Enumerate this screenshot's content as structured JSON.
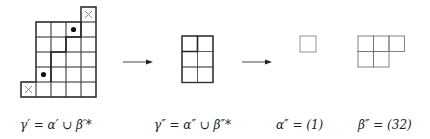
{
  "colors": {
    "grid_line": "#555555",
    "thick_line": "#222222",
    "light_line": "#888888",
    "dot": "#111111",
    "cross": "#888888"
  },
  "diagrams": {
    "gamma_prime": {
      "cell_size": 15,
      "origin": [
        21,
        7
      ],
      "rows": [
        {
          "row": 0,
          "cols": [
            4
          ]
        },
        {
          "row": 1,
          "cols": [
            1,
            2,
            3,
            4
          ]
        },
        {
          "row": 2,
          "cols": [
            1,
            2,
            3,
            4
          ]
        },
        {
          "row": 3,
          "cols": [
            1,
            2,
            3,
            4
          ]
        },
        {
          "row": 4,
          "cols": [
            1,
            2,
            3,
            4
          ]
        },
        {
          "row": 5,
          "cols": [
            0,
            1,
            2,
            3,
            4
          ]
        }
      ],
      "crosses": [
        {
          "row": 0,
          "col": 4
        },
        {
          "row": 5,
          "col": 0
        }
      ],
      "dots": [
        {
          "row": 1,
          "col": 3
        },
        {
          "row": 4,
          "col": 1
        }
      ]
    },
    "gamma_double_prime": {
      "rows": 3,
      "cols": 2
    },
    "alpha_double_prime": {
      "partition": [
        1
      ]
    },
    "beta_double_prime": {
      "partition": [
        3,
        2
      ]
    }
  },
  "labels": {
    "gamma_prime": "γ′ = α′ ∪ β′*",
    "gamma_double_prime": "γ″ = α″ ∪ β″*",
    "alpha_double_prime": "α″ = (1)",
    "beta_double_prime": "β″ = (32)"
  }
}
